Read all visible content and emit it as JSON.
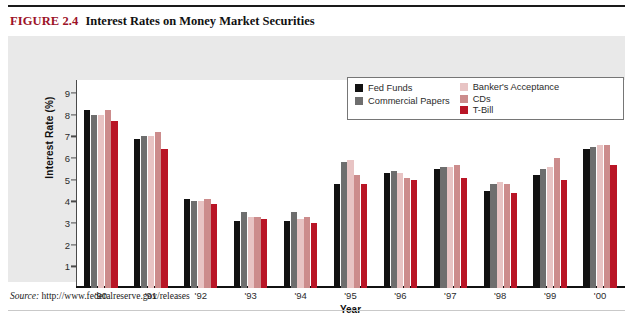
{
  "figure": {
    "number": "FIGURE 2.4",
    "title": "Interest Rates on Money Market Securities",
    "number_color": "#9c1228"
  },
  "source": {
    "label": "Source:",
    "url": "http://www.federalreserve.gov/releases"
  },
  "legend": {
    "columns": [
      [
        {
          "label": "Fed Funds",
          "color": "#111111"
        },
        {
          "label": "Commercial Papers",
          "color": "#6e6e6e"
        }
      ],
      [
        {
          "label": "Banker's Acceptance",
          "color": "#e8c4c4"
        },
        {
          "label": "CDs",
          "color": "#cc8c8c"
        },
        {
          "label": "T-Bill",
          "color": "#b91526"
        }
      ]
    ]
  },
  "chart_data": {
    "type": "bar",
    "title": "Interest Rates on Money Market Securities",
    "xlabel": "Year",
    "ylabel": "Interest Rate (%)",
    "ylim": [
      0,
      9.6
    ],
    "yticks": [
      1,
      2,
      3,
      4,
      5,
      6,
      7,
      8,
      9
    ],
    "grid": false,
    "legend_position": "top-right",
    "categories": [
      "'90",
      "'91",
      "'92",
      "'93",
      "'94",
      "'95",
      "'96",
      "'97",
      "'98",
      "'99",
      "'00"
    ],
    "series": [
      {
        "name": "Fed Funds",
        "color": "#111111",
        "values": [
          8.2,
          6.9,
          4.1,
          3.1,
          3.1,
          4.8,
          5.3,
          5.5,
          4.5,
          5.2,
          6.4
        ]
      },
      {
        "name": "Commercial Papers",
        "color": "#6e6e6e",
        "values": [
          8.0,
          7.0,
          4.0,
          3.5,
          3.5,
          5.8,
          5.4,
          5.6,
          4.8,
          5.5,
          6.5
        ]
      },
      {
        "name": "Banker's Acceptance",
        "color": "#e8c4c4",
        "values": [
          8.0,
          7.0,
          4.0,
          3.3,
          3.2,
          5.9,
          5.3,
          5.6,
          4.9,
          5.6,
          6.6
        ]
      },
      {
        "name": "CDs",
        "color": "#cc8c8c",
        "values": [
          8.2,
          7.2,
          4.1,
          3.3,
          3.3,
          5.2,
          5.1,
          5.7,
          4.8,
          6.0,
          6.6
        ]
      },
      {
        "name": "T-Bill",
        "color": "#b91526",
        "values": [
          7.7,
          6.4,
          3.9,
          3.2,
          3.0,
          4.8,
          5.0,
          5.1,
          4.4,
          5.0,
          5.7
        ]
      }
    ]
  }
}
